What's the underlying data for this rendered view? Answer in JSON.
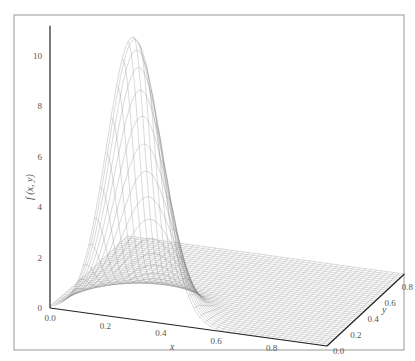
{
  "chart_data": {
    "type": "surface-3d-wireframe",
    "title": "",
    "xlabel": "x",
    "ylabel": "y",
    "zlabel": "f (x, y)",
    "x_ticks": [
      "0.0",
      "0.2",
      "0.4",
      "0.6",
      "0.8"
    ],
    "y_ticks": [
      "0.0",
      "0.2",
      "0.4",
      "0.6",
      "0.8"
    ],
    "z_ticks": [
      "0",
      "2",
      "4",
      "6",
      "8",
      "10"
    ],
    "xlim": [
      0,
      1
    ],
    "ylim": [
      0,
      0.9
    ],
    "zlim": [
      0,
      11.2
    ],
    "peak": {
      "x": 0.3,
      "y": 0.0,
      "z": 11.2
    },
    "surface": {
      "description": "single Gaussian-like bump near x=0.3, y=0, decaying to flat plane",
      "amplitude": 11.2,
      "x_center": 0.3,
      "x_sigma": 0.095,
      "y_sigma": 0.13,
      "grid_x": 50,
      "grid_y": 40
    },
    "colors": {
      "mesh": "#777777",
      "axis": "#222222",
      "frame": "#999999"
    }
  }
}
